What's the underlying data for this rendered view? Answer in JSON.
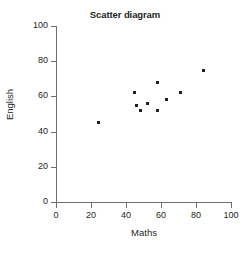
{
  "chart_data": {
    "type": "scatter",
    "title": "Scatter diagram",
    "xlabel": "Maths",
    "ylabel": "English",
    "xlim": [
      0,
      100
    ],
    "ylim": [
      0,
      100
    ],
    "xticks": [
      0,
      20,
      40,
      60,
      80,
      100
    ],
    "yticks": [
      0,
      20,
      40,
      60,
      80,
      100
    ],
    "grid": false,
    "legend": null,
    "marker_color": "#231f20",
    "axis_color": "#6d6e71",
    "background_color": "#ffffff",
    "points": [
      {
        "x": 24,
        "y": 45
      },
      {
        "x": 45,
        "y": 62
      },
      {
        "x": 46,
        "y": 55
      },
      {
        "x": 48,
        "y": 52
      },
      {
        "x": 52,
        "y": 56
      },
      {
        "x": 58,
        "y": 68
      },
      {
        "x": 58,
        "y": 52
      },
      {
        "x": 63,
        "y": 58
      },
      {
        "x": 71,
        "y": 62
      },
      {
        "x": 84,
        "y": 75
      }
    ]
  }
}
